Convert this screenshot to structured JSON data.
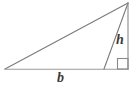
{
  "figure": {
    "kind": "geometry-diagram",
    "background_color": "#ffffff",
    "stroke_color": "#7a7a7a",
    "label_color": "#3a3a3a",
    "stroke_width": 1,
    "labels": {
      "base": "b",
      "height": "h"
    },
    "vertices": {
      "left": {
        "x": 5,
        "y": 69
      },
      "apex": {
        "x": 128,
        "y": 3
      },
      "base_right": {
        "x": 104,
        "y": 69
      },
      "foot": {
        "x": 128,
        "y": 69
      }
    },
    "segments": [
      {
        "name": "hypotenuse-left-to-apex",
        "x1": 5,
        "y1": 69,
        "x2": 128,
        "y2": 3
      },
      {
        "name": "base-line",
        "x1": 5,
        "y1": 69,
        "x2": 128,
        "y2": 69
      },
      {
        "name": "triangle-right-side",
        "x1": 128,
        "y1": 3,
        "x2": 104,
        "y2": 69
      },
      {
        "name": "height-line",
        "x1": 128,
        "y1": 3,
        "x2": 128,
        "y2": 69
      }
    ],
    "right_angle_marker": {
      "x": 117,
      "y": 58,
      "size": 11
    }
  }
}
